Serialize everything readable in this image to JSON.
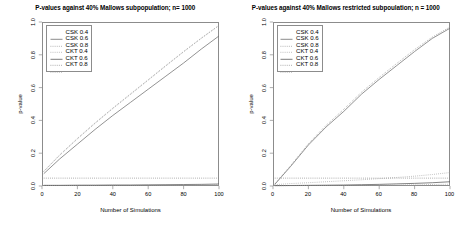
{
  "figure": {
    "background": "#ffffff",
    "frame_color": "#8c8c8c"
  },
  "chart_data": [
    {
      "type": "line",
      "panel": "left",
      "title": "P-values against 40% Mallows subpopulation; n= 1000",
      "xlabel": "Number of Simulations",
      "ylabel": "p-value",
      "xlim": [
        0,
        100
      ],
      "ylim": [
        0.0,
        1.0
      ],
      "xticks": [
        0,
        20,
        40,
        60,
        80,
        100
      ],
      "yticks": [
        "0.0",
        "0.2",
        "0.4",
        "0.6",
        "0.8",
        "1.0"
      ],
      "grid": false,
      "legend_position": "top-left",
      "x": [
        1,
        10,
        20,
        30,
        40,
        50,
        60,
        70,
        80,
        90,
        100
      ],
      "series": [
        {
          "name": "CSK 0.4",
          "style": "solid",
          "color": "#6f6f6f",
          "values": [
            0.075,
            0.165,
            0.255,
            0.345,
            0.43,
            0.51,
            0.59,
            0.67,
            0.75,
            0.835,
            0.915
          ]
        },
        {
          "name": "CSK 0.6",
          "style": "dotted",
          "color": "#8a8a8a",
          "values": [
            0.09,
            0.19,
            0.29,
            0.385,
            0.475,
            0.562,
            0.648,
            0.735,
            0.82,
            0.902,
            0.98
          ]
        },
        {
          "name": "CSK 0.8",
          "style": "dashed",
          "color": "#9b9b9b",
          "values": [
            0.088,
            0.187,
            0.287,
            0.382,
            0.472,
            0.558,
            0.645,
            0.732,
            0.818,
            0.9,
            0.978
          ]
        },
        {
          "name": "CKT 0.4",
          "style": "solid",
          "color": "#5a5a5a",
          "values": [
            0.004,
            0.004,
            0.005,
            0.005,
            0.006,
            0.006,
            0.007,
            0.008,
            0.009,
            0.01,
            0.012
          ]
        },
        {
          "name": "CKT 0.6",
          "style": "dotted",
          "color": "#7d7d7d",
          "values": [
            0.048,
            0.048,
            0.048,
            0.048,
            0.048,
            0.048,
            0.048,
            0.048,
            0.048,
            0.048,
            0.048
          ]
        },
        {
          "name": "CKT 0.8",
          "style": "dashed",
          "color": "#9a9a9a",
          "values": [
            0.003,
            0.003,
            0.003,
            0.004,
            0.004,
            0.004,
            0.005,
            0.005,
            0.006,
            0.007,
            0.008
          ]
        }
      ]
    },
    {
      "type": "line",
      "panel": "right",
      "title": "P-values against 40% Mallows restricted subpoulation; n = 1000",
      "xlabel": "Number of Simulations",
      "ylabel": "p-value",
      "xlim": [
        0,
        100
      ],
      "ylim": [
        0.0,
        1.0
      ],
      "xticks": [
        0,
        20,
        40,
        60,
        80,
        100
      ],
      "yticks": [
        "0.0",
        "0.2",
        "0.4",
        "0.6",
        "0.8",
        "1.0"
      ],
      "grid": false,
      "legend_position": "top-left",
      "x": [
        1,
        10,
        20,
        30,
        40,
        50,
        60,
        70,
        80,
        90,
        100
      ],
      "series": [
        {
          "name": "CSK 0.4",
          "style": "solid",
          "color": "#6f6f6f",
          "values": [
            0.01,
            0.12,
            0.25,
            0.36,
            0.455,
            0.56,
            0.65,
            0.735,
            0.82,
            0.9,
            0.962
          ]
        },
        {
          "name": "CSK 0.6",
          "style": "dotted",
          "color": "#8a8a8a",
          "values": [
            0.012,
            0.125,
            0.258,
            0.37,
            0.468,
            0.572,
            0.662,
            0.748,
            0.832,
            0.908,
            0.97
          ]
        },
        {
          "name": "CSK 0.8",
          "style": "dashed",
          "color": "#9b9b9b",
          "values": [
            0.008,
            0.015,
            0.02,
            0.026,
            0.032,
            0.038,
            0.045,
            0.052,
            0.06,
            0.07,
            0.082
          ]
        },
        {
          "name": "CKT 0.4",
          "style": "solid",
          "color": "#5a5a5a",
          "values": [
            0.002,
            0.003,
            0.004,
            0.005,
            0.006,
            0.008,
            0.01,
            0.013,
            0.016,
            0.02,
            0.026
          ]
        },
        {
          "name": "CKT 0.6",
          "style": "dotted",
          "color": "#7d7d7d",
          "values": [
            0.048,
            0.048,
            0.048,
            0.048,
            0.048,
            0.048,
            0.048,
            0.048,
            0.048,
            0.048,
            0.048
          ]
        },
        {
          "name": "CKT 0.8",
          "style": "dashed",
          "color": "#9a9a9a",
          "values": [
            0.002,
            0.002,
            0.003,
            0.003,
            0.004,
            0.004,
            0.005,
            0.006,
            0.007,
            0.009,
            0.011
          ]
        }
      ]
    }
  ]
}
